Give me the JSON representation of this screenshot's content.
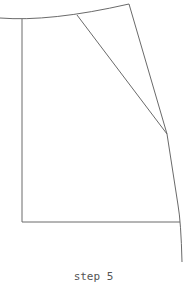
{
  "diagram": {
    "caption": "step 5",
    "stroke_color": "#6a6a6a",
    "background": "#ffffff"
  }
}
